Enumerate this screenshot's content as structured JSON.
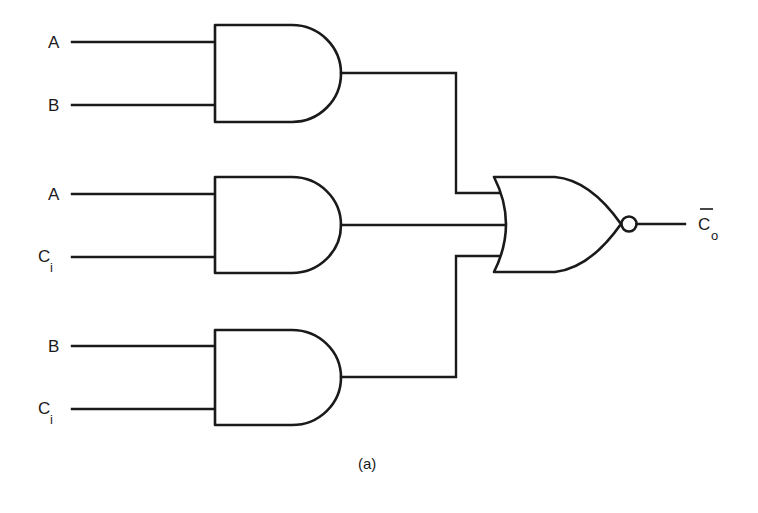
{
  "diagram": {
    "type": "logic-circuit",
    "caption": "(a)",
    "gates": [
      {
        "id": "and1",
        "type": "AND",
        "inputs": [
          {
            "label": "A",
            "sub": ""
          },
          {
            "label": "B",
            "sub": ""
          }
        ]
      },
      {
        "id": "and2",
        "type": "AND",
        "inputs": [
          {
            "label": "A",
            "sub": ""
          },
          {
            "label": "C",
            "sub": "i"
          }
        ]
      },
      {
        "id": "and3",
        "type": "AND",
        "inputs": [
          {
            "label": "B",
            "sub": ""
          },
          {
            "label": "C",
            "sub": "i"
          }
        ]
      },
      {
        "id": "nor1",
        "type": "NOR",
        "inputs": [
          "and1",
          "and2",
          "and3"
        ]
      }
    ],
    "output": {
      "label": "C",
      "sub": "o",
      "overbar": true
    },
    "colors": {
      "line": "#1a1a1a",
      "background": "#ffffff"
    }
  }
}
